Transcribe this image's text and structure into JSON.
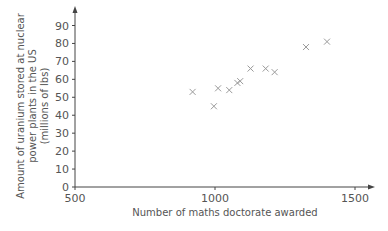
{
  "chart_data": {
    "type": "scatter",
    "title": "",
    "xlabel": "Number of maths doctorate awarded",
    "ylabel_lines": [
      "Amount of uranium stored at nuclear",
      "power plants in the US",
      "(millions of lbs)"
    ],
    "xlim": [
      500,
      1500
    ],
    "ylim": [
      0,
      90
    ],
    "x_ticks": [
      500,
      1000,
      1500
    ],
    "y_ticks": [
      0,
      10,
      20,
      30,
      40,
      50,
      60,
      70,
      80,
      90
    ],
    "grid": false,
    "marker": "x",
    "marker_color": "#9a9a9a",
    "axis_color": "#444444",
    "points": [
      {
        "x": 920,
        "y": 53
      },
      {
        "x": 996,
        "y": 45
      },
      {
        "x": 1011,
        "y": 55
      },
      {
        "x": 1051,
        "y": 54
      },
      {
        "x": 1080,
        "y": 58
      },
      {
        "x": 1090,
        "y": 59
      },
      {
        "x": 1127,
        "y": 66
      },
      {
        "x": 1181,
        "y": 66
      },
      {
        "x": 1213,
        "y": 64
      },
      {
        "x": 1325,
        "y": 78
      },
      {
        "x": 1400,
        "y": 81
      }
    ]
  }
}
